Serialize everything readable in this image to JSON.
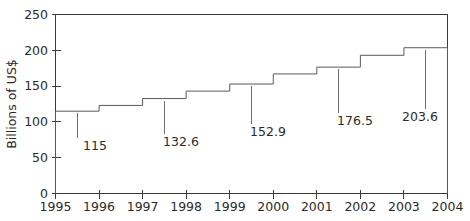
{
  "chart_data": {
    "type": "bar",
    "title": "",
    "subtitle": "",
    "xlabel": "",
    "ylabel": "Billions of US$",
    "ylim": [
      0,
      250
    ],
    "xlim": [
      1995,
      2004
    ],
    "grid": false,
    "legend": "none",
    "y_ticks": [
      "0",
      "50",
      "100",
      "150",
      "200",
      "250"
    ],
    "y_tick_values": [
      0,
      50,
      100,
      150,
      200,
      250
    ],
    "x_ticks": [
      "1995",
      "1996",
      "1997",
      "1998",
      "1999",
      "2000",
      "2001",
      "2002",
      "2003",
      "2004"
    ],
    "x_tick_values": [
      1995,
      1996,
      1997,
      1998,
      1999,
      2000,
      2001,
      2002,
      2003,
      2004
    ],
    "categories": [
      "1995",
      "1996",
      "1997",
      "1998",
      "1999",
      "2000",
      "2001",
      "2002",
      "2003"
    ],
    "values": [
      115,
      123,
      132.6,
      143,
      152.9,
      167,
      176.5,
      193,
      203.6
    ],
    "annotations": [
      {
        "text": "115",
        "value": 115,
        "segment_index": 0
      },
      {
        "text": "132.6",
        "value": 132.6,
        "segment_index": 2
      },
      {
        "text": "152.9",
        "value": 152.9,
        "segment_index": 4
      },
      {
        "text": "176.5",
        "value": 176.5,
        "segment_index": 6
      },
      {
        "text": "203.6",
        "value": 203.6,
        "segment_index": 8
      }
    ],
    "colors": {
      "background": "#ffffff",
      "axis": "#3a3a3a",
      "series_line": "#5a5a5a",
      "text": "#2b2b2b",
      "leader": "#6e6e6e"
    }
  }
}
